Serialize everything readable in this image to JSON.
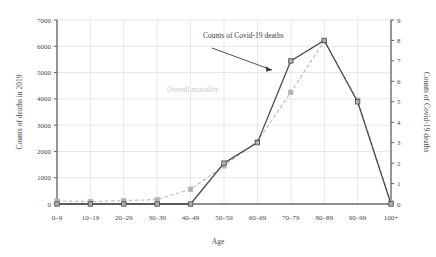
{
  "chart_data": {
    "type": "line",
    "title": "",
    "xlabel": "Age",
    "categories": [
      "0–9",
      "10–19",
      "20–29",
      "30–39",
      "40–49",
      "50–59",
      "60–69",
      "70–79",
      "80–89",
      "90–99",
      "100+"
    ],
    "grid": true,
    "legend_position": "inline-annotations",
    "axes": {
      "left": {
        "label": "Counts of deaths in 2019",
        "ticks": [
          "0",
          "1000",
          "2000",
          "3000",
          "4000",
          "5000",
          "6000",
          "7000"
        ],
        "tick_values": [
          0,
          1000,
          2000,
          3000,
          4000,
          5000,
          6000,
          7000
        ],
        "ylim": [
          0,
          7000
        ]
      },
      "right": {
        "label": "Counts of Covid-19 deaths",
        "ticks": [
          "0",
          "1",
          "2",
          "3",
          "4",
          "5",
          "6",
          "7",
          "8",
          "9"
        ],
        "tick_values": [
          0,
          1,
          2,
          3,
          4,
          5,
          6,
          7,
          8,
          9
        ],
        "ylim": [
          0,
          9
        ]
      }
    },
    "series": [
      {
        "name": "Overall mortality",
        "axis": "left",
        "style": "dashed",
        "color": "#b9b9b9",
        "marker": "square",
        "values": [
          120,
          90,
          130,
          170,
          560,
          1450,
          2380,
          4250,
          6200,
          3950,
          60
        ]
      },
      {
        "name": "Counts of Covid-19 deaths",
        "axis": "right",
        "style": "solid",
        "color": "#4c4c4c",
        "marker": "square",
        "values": [
          0,
          0,
          0,
          0,
          0,
          2,
          3,
          7,
          8,
          5,
          0
        ]
      }
    ],
    "annotations": [
      {
        "name": "covid-label",
        "text": "Counts of  Covid-19 deaths",
        "x": 203,
        "y": 38
      },
      {
        "name": "overall-label",
        "text": "Overall mortality",
        "x": 167,
        "y": 92
      }
    ]
  }
}
